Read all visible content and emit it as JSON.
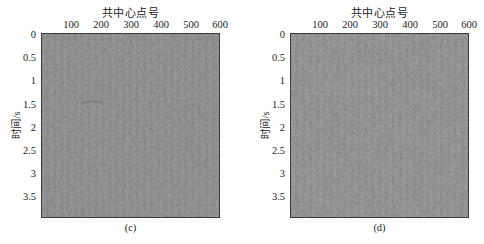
{
  "chart_data": [
    {
      "id": "c",
      "type": "heatmap",
      "title": "",
      "xlabel": "共中心点号",
      "ylabel": "时间/s",
      "x_axis_position": "top",
      "xticks": [
        100,
        200,
        300,
        400,
        500,
        600
      ],
      "yticks": [
        "0",
        "0.5",
        "1",
        "1.5",
        "2",
        "2.5",
        "3",
        "3.5"
      ],
      "xlim": [
        0,
        600
      ],
      "ylim": [
        0,
        4
      ],
      "y_reversed": true,
      "colormap": "gray",
      "description": "Seismic section showing near-uniform gray noise (residual), faint event near 1.5 s around CMP 150-200",
      "caption": "(c)",
      "fill_color": "#8f8f8f"
    },
    {
      "id": "d",
      "type": "heatmap",
      "title": "",
      "xlabel": "共中心点号",
      "ylabel": "时间/s",
      "x_axis_position": "top",
      "xticks": [
        100,
        200,
        300,
        400,
        500,
        600
      ],
      "yticks": [
        "0",
        "0.5",
        "1",
        "1.5",
        "2",
        "2.5",
        "3",
        "3.5"
      ],
      "xlim": [
        0,
        600
      ],
      "ylim": [
        0,
        4
      ],
      "y_reversed": true,
      "colormap": "gray",
      "description": "Seismic section showing near-uniform gray noise (residual)",
      "caption": "(d)",
      "fill_color": "#939393"
    }
  ],
  "panels": [
    {
      "xlabel": "共中心点号",
      "ylabel": "时间/s",
      "caption": "(c)",
      "xticks": [
        "100",
        "200",
        "300",
        "400",
        "500",
        "600"
      ],
      "yticks": [
        "0",
        "0.5",
        "1",
        "1.5",
        "2",
        "2.5",
        "3",
        "3.5"
      ]
    },
    {
      "xlabel": "共中心点号",
      "ylabel": "时间/s",
      "caption": "(d)",
      "xticks": [
        "100",
        "200",
        "300",
        "400",
        "500",
        "600"
      ],
      "yticks": [
        "0",
        "0.5",
        "1",
        "1.5",
        "2",
        "2.5",
        "3",
        "3.5"
      ]
    }
  ]
}
